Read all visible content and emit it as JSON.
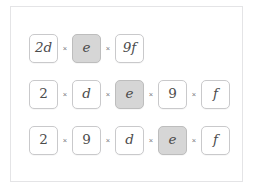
{
  "card": {
    "border_color": "#e4e4e6",
    "background": "#ffffff"
  },
  "style": {
    "tile_border": "#c9c9cb",
    "tile_background": "#ffffff",
    "highlight_background": "#d6d6d6",
    "highlight_border": "#bdbdbd",
    "text_color": "#4c4c4c",
    "operator_color": "#77777a"
  },
  "operator": {
    "symbol": "×",
    "name": "multiplication-sign"
  },
  "rows": [
    {
      "label": "expression-row-1",
      "tiles": [
        {
          "text": "2d",
          "kind": "mixed",
          "highlight": false
        },
        {
          "text": "e",
          "kind": "variable",
          "highlight": true
        },
        {
          "text": "9f",
          "kind": "mixed",
          "highlight": false
        }
      ]
    },
    {
      "label": "expression-row-2",
      "tiles": [
        {
          "text": "2",
          "kind": "numeric",
          "highlight": false
        },
        {
          "text": "d",
          "kind": "variable",
          "highlight": false
        },
        {
          "text": "e",
          "kind": "variable",
          "highlight": true
        },
        {
          "text": "9",
          "kind": "numeric",
          "highlight": false
        },
        {
          "text": "f",
          "kind": "variable",
          "highlight": false
        }
      ]
    },
    {
      "label": "expression-row-3",
      "tiles": [
        {
          "text": "2",
          "kind": "numeric",
          "highlight": false
        },
        {
          "text": "9",
          "kind": "numeric",
          "highlight": false
        },
        {
          "text": "d",
          "kind": "variable",
          "highlight": false
        },
        {
          "text": "e",
          "kind": "variable",
          "highlight": true
        },
        {
          "text": "f",
          "kind": "variable",
          "highlight": false
        }
      ]
    }
  ]
}
